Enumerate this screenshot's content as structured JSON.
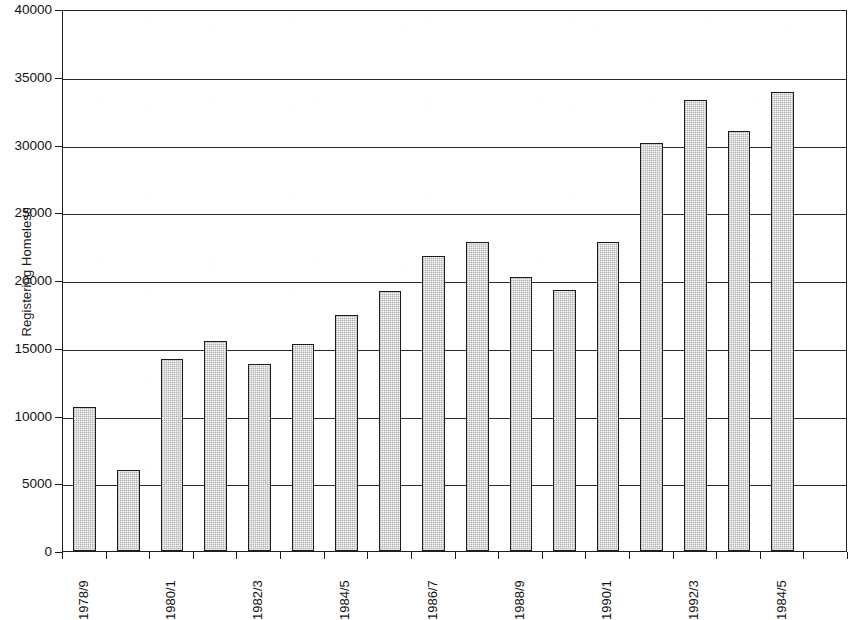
{
  "chart_data": {
    "type": "bar",
    "title": "",
    "subtitle": "",
    "xlabel": "",
    "ylabel": "Registering Homeless",
    "ylim": [
      0,
      40000
    ],
    "ytick_interval": 5000,
    "ytick_labels": [
      "40000",
      "35000",
      "30000",
      "25000",
      "20000",
      "15000",
      "10000",
      "5000",
      "0"
    ],
    "ytick_values": [
      40000,
      35000,
      30000,
      25000,
      20000,
      15000,
      10000,
      5000,
      0
    ],
    "grid": true,
    "grid_axis": "y",
    "legend": false,
    "legend_position": "none",
    "bar_fill_color": "#cfcfcf",
    "bar_border_color": "#1c1c1c",
    "axis_color": "#1f1f1f",
    "background_color": "#ffffff",
    "categories": [
      "1978/9",
      "",
      "1980/1",
      "",
      "1982/3",
      "",
      "1984/5",
      "",
      "1986/7",
      "",
      "1988/9",
      "",
      "1990/1",
      "",
      "1992/3",
      "",
      "1984/5",
      ""
    ],
    "xtick_labels_visible": [
      "1978/9",
      "1980/1",
      "1982/3",
      "1984/5",
      "1986/7",
      "1988/9",
      "1990/1",
      "1992/3",
      "1984/5"
    ],
    "values": [
      10600,
      6000,
      14200,
      15500,
      13800,
      15300,
      17400,
      19200,
      21800,
      22800,
      20200,
      19300,
      22800,
      30100,
      33300,
      31000,
      33900,
      0
    ],
    "bars": [
      {
        "label": "1978/9",
        "value": 10600
      },
      {
        "label": "",
        "value": 6000
      },
      {
        "label": "1980/1",
        "value": 14200
      },
      {
        "label": "",
        "value": 15500
      },
      {
        "label": "1982/3",
        "value": 13800
      },
      {
        "label": "",
        "value": 15300
      },
      {
        "label": "1984/5",
        "value": 17400
      },
      {
        "label": "",
        "value": 19200
      },
      {
        "label": "1986/7",
        "value": 21800
      },
      {
        "label": "",
        "value": 22800
      },
      {
        "label": "1988/9",
        "value": 20200
      },
      {
        "label": "",
        "value": 19300
      },
      {
        "label": "1990/1",
        "value": 22800
      },
      {
        "label": "",
        "value": 30100
      },
      {
        "label": "1992/3",
        "value": 33300
      },
      {
        "label": "",
        "value": 31000
      },
      {
        "label": "1984/5",
        "value": 33900
      },
      {
        "label": "",
        "value": 0
      }
    ]
  }
}
